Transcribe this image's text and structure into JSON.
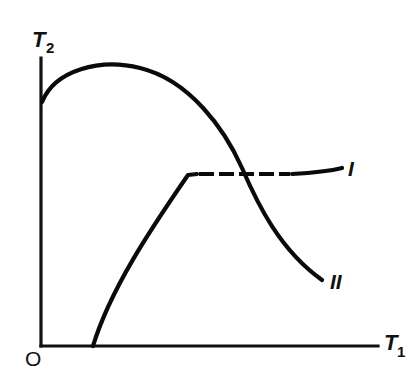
{
  "diagram": {
    "type": "qualitative-curve-plot",
    "axes": {
      "y_label": "T",
      "y_label_subscript": "2",
      "x_label": "T",
      "x_label_subscript": "1",
      "origin_label": "O"
    },
    "curves": [
      {
        "id": "I",
        "label": "I",
        "style": "solid rising segment, then horizontal dashed plateau ending in solid",
        "description": "Starts on T1 axis away from origin, rises concavely to a corner, then stays nearly constant (dashed) toward the right"
      },
      {
        "id": "II",
        "label": "II",
        "style": "solid",
        "description": "Starts at positive T2 intercept, rises to a maximum, then falls steeply crossing curve I and continues down to the right"
      }
    ]
  }
}
